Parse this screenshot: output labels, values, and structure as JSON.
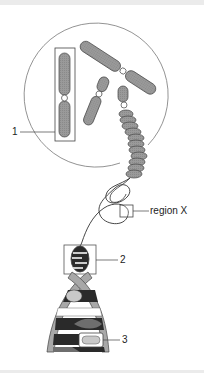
{
  "figure": {
    "labels": {
      "label_1": "1",
      "label_2": "2",
      "label_3": "3",
      "region_x": "region X"
    },
    "colors": {
      "chromatid_fill": "#9a9a9a",
      "outline": "#333333",
      "circle": "#777777",
      "backbone": "#a8a8a8",
      "base_dark": "#2a2a2a",
      "base_mid": "#6e6e6e",
      "base_light": "#c8c8c8"
    }
  }
}
